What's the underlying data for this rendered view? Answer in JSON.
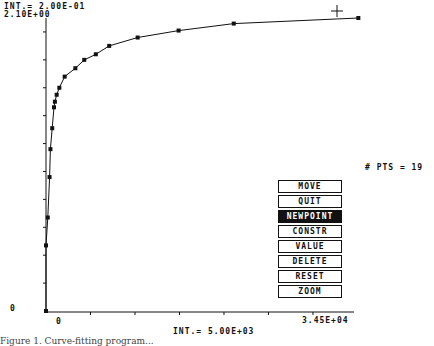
{
  "header": {
    "y_interval_label": "INT.= 2.00E-01",
    "y_max_label": "2.10E+00"
  },
  "axes": {
    "y_origin_label": "0",
    "x_origin_label": "0",
    "x_max_label": "3.45E+04",
    "x_interval_label": "INT.= 5.00E+03"
  },
  "status": {
    "points_label": "# PTS = 19"
  },
  "menu": {
    "items": [
      {
        "label": "MOVE",
        "active": false
      },
      {
        "label": "QUIT",
        "active": false
      },
      {
        "label": "NEWPOINT",
        "active": true
      },
      {
        "label": "CONSTR",
        "active": false
      },
      {
        "label": "VALUE",
        "active": false
      },
      {
        "label": "DELETE",
        "active": false
      },
      {
        "label": "RESET",
        "active": false
      },
      {
        "label": "ZOOM",
        "active": false
      }
    ]
  },
  "caption": "Figure 1. Curve-fitting program...",
  "chart_data": {
    "type": "line",
    "title": "",
    "xlabel": "",
    "ylabel": "",
    "xlim": [
      0,
      34500
    ],
    "ylim": [
      0,
      2.1
    ],
    "x_tick_interval": 5000,
    "y_tick_interval": 0.2,
    "grid": false,
    "legend": "none",
    "series": [
      {
        "name": "data points",
        "x": [
          0,
          0,
          200,
          400,
          500,
          700,
          900,
          1000,
          1200,
          1500,
          2100,
          3300,
          4300,
          5600,
          7100,
          10300,
          14900,
          21100,
          35100
        ],
        "y": [
          0.0,
          0.47,
          0.67,
          0.96,
          1.16,
          1.31,
          1.46,
          1.5,
          1.55,
          1.6,
          1.68,
          1.74,
          1.8,
          1.84,
          1.9,
          1.96,
          2.01,
          2.06,
          2.1
        ]
      }
    ],
    "annotations": [
      "# PTS = 19",
      "+ cursor near top right"
    ]
  }
}
